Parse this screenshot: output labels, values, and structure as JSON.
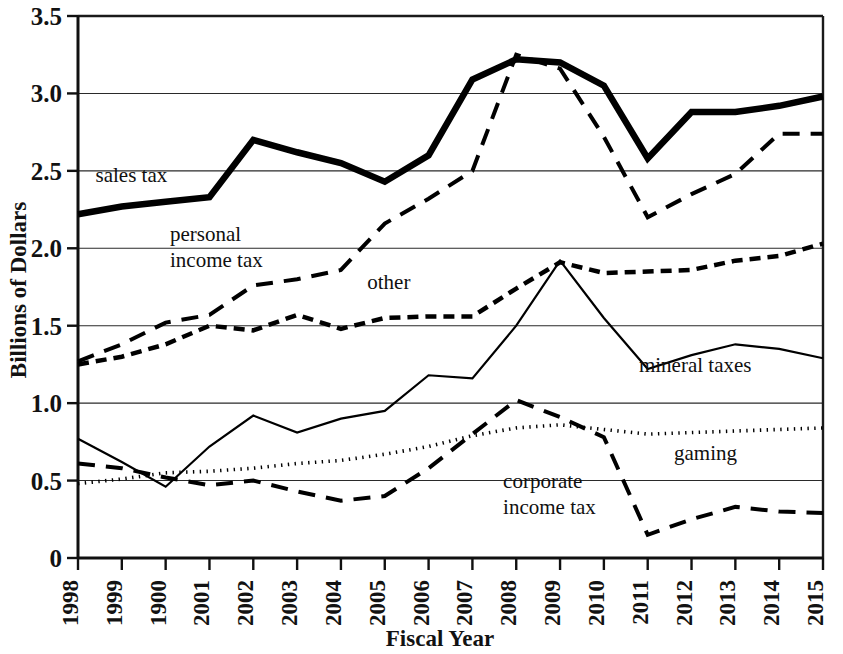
{
  "chart_data": {
    "type": "line",
    "title": "",
    "xlabel": "Fiscal Year",
    "ylabel": "Billions of Dollars",
    "ylim": [
      0,
      3.5
    ],
    "ytick_labels": [
      "0",
      "0.5",
      "1.0",
      "1.5",
      "2.0",
      "2.5",
      "3.0",
      "3.5"
    ],
    "ytick_values": [
      0,
      0.5,
      1.0,
      1.5,
      2.0,
      2.5,
      3.0,
      3.5
    ],
    "grid": true,
    "legend_position": "inline-labels",
    "categories": [
      "1998",
      "1999",
      "1900",
      "2001",
      "2002",
      "2003",
      "2004",
      "2005",
      "2006",
      "2007",
      "2008",
      "2009",
      "2010",
      "2011",
      "2012",
      "2013",
      "2014",
      "2015"
    ],
    "series": [
      {
        "name": "sales tax",
        "style": "thick-solid",
        "label_x": 1998.4,
        "label_y": 2.43,
        "values": [
          2.22,
          2.27,
          2.3,
          2.33,
          2.7,
          2.62,
          2.55,
          2.43,
          2.6,
          3.09,
          3.22,
          3.2,
          3.05,
          2.58,
          2.88,
          2.88,
          2.92,
          2.98
        ]
      },
      {
        "name": "personal\nincome tax",
        "style": "long-dash",
        "label_x": 2000.1,
        "label_y": 2.05,
        "values": [
          1.27,
          1.38,
          1.52,
          1.57,
          1.76,
          1.8,
          1.86,
          2.16,
          2.32,
          2.5,
          3.25,
          3.16,
          2.72,
          2.2,
          2.35,
          2.48,
          2.74,
          2.74
        ]
      },
      {
        "name": "other",
        "style": "short-dash",
        "label_x": 2004.6,
        "label_y": 1.74,
        "values": [
          1.25,
          1.3,
          1.38,
          1.5,
          1.47,
          1.57,
          1.48,
          1.55,
          1.56,
          1.56,
          1.74,
          1.91,
          1.84,
          1.85,
          1.86,
          1.92,
          1.95,
          2.03
        ]
      },
      {
        "name": "mineral taxes",
        "style": "thin-solid",
        "label_x": 2010.8,
        "label_y": 1.2,
        "values": [
          0.77,
          0.62,
          0.46,
          0.72,
          0.92,
          0.81,
          0.9,
          0.95,
          1.18,
          1.16,
          1.5,
          1.92,
          1.55,
          1.22,
          1.31,
          1.38,
          1.35,
          1.29
        ]
      },
      {
        "name": "gaming",
        "style": "dotted",
        "label_x": 2011.6,
        "label_y": 0.63,
        "values": [
          0.48,
          0.51,
          0.55,
          0.56,
          0.58,
          0.61,
          0.63,
          0.67,
          0.72,
          0.79,
          0.84,
          0.86,
          0.83,
          0.8,
          0.81,
          0.82,
          0.83,
          0.84
        ]
      },
      {
        "name": "corporate\nincome tax",
        "style": "long-dash",
        "label_x": 2007.7,
        "label_y": 0.45,
        "values": [
          0.61,
          0.58,
          0.52,
          0.47,
          0.5,
          0.43,
          0.37,
          0.4,
          0.58,
          0.8,
          1.02,
          0.91,
          0.78,
          0.15,
          0.25,
          0.33,
          0.3,
          0.29
        ]
      }
    ]
  },
  "axes": {
    "x_title": "Fiscal Year",
    "y_title": "Billions of Dollars"
  },
  "labels": {
    "sales_tax": "sales tax",
    "personal_income_tax_line1": "personal",
    "personal_income_tax_line2": "income tax",
    "other": "other",
    "mineral_taxes": "mineral taxes",
    "gaming": "gaming",
    "corporate_income_tax_line1": "corporate",
    "corporate_income_tax_line2": "income tax"
  }
}
